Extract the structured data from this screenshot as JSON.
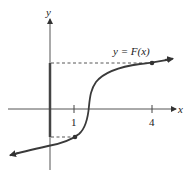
{
  "figure": {
    "type": "function-graph",
    "function_label": "y = F(x)",
    "axes": {
      "x_label": "x",
      "y_label": "y"
    },
    "x_ticks": [
      {
        "value": 1,
        "label": "1"
      },
      {
        "value": 4,
        "label": "4"
      }
    ],
    "marked_points": [
      {
        "x": 1,
        "name": "(1, F(1))"
      },
      {
        "x": 4,
        "name": "(4, F(4))"
      }
    ],
    "highlighted_range": "segment on y-axis from F(1) to F(4)",
    "colors": {
      "curve": "#3a3a3a",
      "axes": "#555555",
      "highlight": "#444444"
    }
  }
}
